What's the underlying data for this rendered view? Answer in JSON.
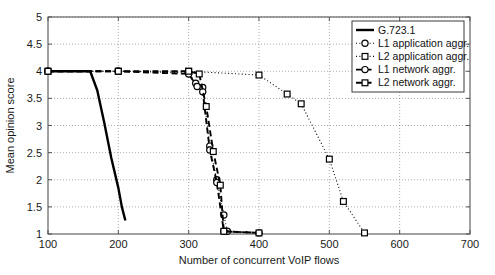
{
  "chart_data": {
    "type": "line",
    "title": "",
    "xlabel": "Number of concurrent VoIP flows",
    "ylabel": "Mean opinion score",
    "xlim": [
      100,
      700
    ],
    "ylim": [
      1,
      5
    ],
    "xticks": [
      100,
      200,
      300,
      400,
      500,
      600,
      700
    ],
    "xtick_labels": [
      "100",
      "200",
      "300",
      "400",
      "500",
      "600",
      "700"
    ],
    "yticks": [
      1,
      1.5,
      2,
      2.5,
      3,
      3.5,
      4,
      4.5,
      5
    ],
    "ytick_labels": [
      "1",
      "1.5",
      "2",
      "2.5",
      "3",
      "3.5",
      "4",
      "4.5",
      "5"
    ],
    "grid": "dotted-horizontal",
    "legend_position": "top-right",
    "series": [
      {
        "name": "G.723.1",
        "line_style": "solid",
        "marker": "none",
        "color": "#000000",
        "x": [
          100,
          130,
          160,
          170,
          180,
          190,
          200,
          205,
          210
        ],
        "y": [
          4.0,
          4.0,
          4.0,
          3.65,
          3.05,
          2.4,
          1.85,
          1.5,
          1.25
        ]
      },
      {
        "name": "L1 application aggr.",
        "line_style": "dotted",
        "marker": "circle",
        "color": "#000000",
        "x": [
          100,
          200,
          300,
          310,
          320,
          330,
          340,
          350,
          355
        ],
        "y": [
          4.0,
          4.0,
          3.97,
          3.78,
          3.7,
          2.62,
          2.0,
          1.35,
          1.05
        ]
      },
      {
        "name": "L2 application aggr.",
        "line_style": "dotted",
        "marker": "square",
        "color": "#000000",
        "x": [
          100,
          200,
          300,
          400,
          440,
          460,
          500,
          520,
          550
        ],
        "y": [
          4.0,
          4.0,
          4.0,
          3.93,
          3.58,
          3.4,
          2.38,
          1.6,
          1.02
        ]
      },
      {
        "name": "L1 network aggr.",
        "line_style": "dashed",
        "marker": "circle",
        "color": "#000000",
        "x": [
          100,
          200,
          300,
          312,
          320,
          330,
          340,
          350,
          400
        ],
        "y": [
          4.0,
          4.0,
          3.95,
          3.72,
          3.62,
          2.55,
          1.95,
          1.05,
          1.02
        ]
      },
      {
        "name": "L2 network aggr.",
        "line_style": "dashed",
        "marker": "square",
        "color": "#000000",
        "x": [
          100,
          200,
          300,
          315,
          325,
          335,
          345,
          350,
          400
        ],
        "y": [
          4.0,
          4.0,
          4.0,
          3.95,
          3.35,
          2.52,
          1.9,
          1.05,
          1.02
        ]
      }
    ]
  },
  "legend": {
    "items": [
      {
        "label": "G.723.1",
        "style": "solid",
        "marker": "none"
      },
      {
        "label": "L1 application aggr.",
        "style": "dotted",
        "marker": "circle"
      },
      {
        "label": "L2 application aggr.",
        "style": "dotted",
        "marker": "square"
      },
      {
        "label": "L1 network aggr.",
        "style": "dashed",
        "marker": "circle"
      },
      {
        "label": "L2 network aggr.",
        "style": "dashed",
        "marker": "square"
      }
    ]
  }
}
